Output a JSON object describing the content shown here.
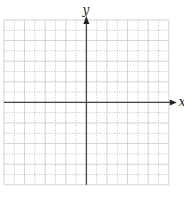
{
  "diagram": {
    "type": "coordinate-grid",
    "x_axis_label": "x",
    "y_axis_label": "y",
    "grid": {
      "columns": 16,
      "rows": 16,
      "left": 4,
      "top": 20,
      "cell": 10.3,
      "origin_col": 8,
      "origin_row": 8
    },
    "colors": {
      "grid_solid": "#c8c8c8",
      "grid_dotted": "#b0b0b0",
      "axis": "#444444"
    }
  }
}
